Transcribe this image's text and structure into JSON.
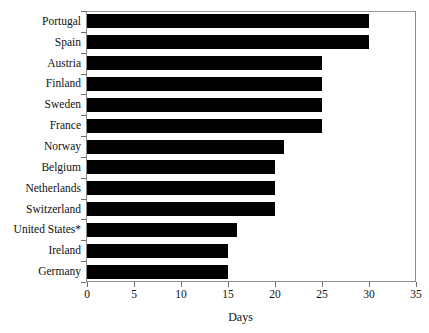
{
  "chart_data": {
    "type": "bar",
    "orientation": "horizontal",
    "title": "",
    "subtitle": "",
    "xlabel": "Days",
    "ylabel": "",
    "xlim": [
      0,
      35
    ],
    "xticks": [
      0,
      5,
      10,
      15,
      20,
      25,
      30,
      35
    ],
    "xtick_labels": [
      "0",
      "5",
      "10",
      "15",
      "20",
      "25",
      "30",
      "35"
    ],
    "grid": false,
    "legend": null,
    "bar_color": "#000000",
    "categories": [
      "Portugal",
      "Spain",
      "Austria",
      "Finland",
      "Sweden",
      "France",
      "Norway",
      "Belgium",
      "Netherlands",
      "Switzerland",
      "United States*",
      "Ireland",
      "Germany"
    ],
    "values": [
      30,
      30,
      25,
      25,
      25,
      25,
      21,
      20,
      20,
      20,
      16,
      15,
      15
    ],
    "annotations": [
      "* asterisk on United States label"
    ]
  },
  "axis": {
    "x_title": "Days"
  }
}
